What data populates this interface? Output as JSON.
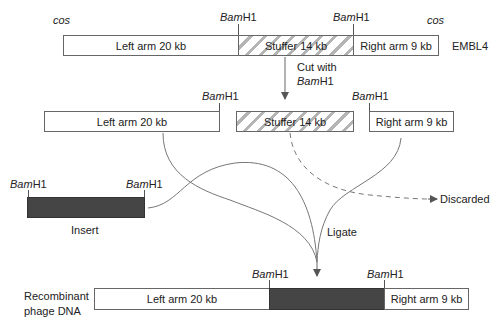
{
  "diagram": {
    "vector": {
      "name": "EMBL4",
      "cos_left": "cos",
      "cos_right": "cos",
      "site_left": {
        "italic": "Bam",
        "plain": "H1"
      },
      "site_right": {
        "italic": "Bam",
        "plain": "H1"
      },
      "segments": [
        {
          "label": "Left arm 20 kb",
          "fill": "white"
        },
        {
          "label": "Stuffer 14 kb",
          "fill": "hatched"
        },
        {
          "label": "Right arm 9 kb",
          "fill": "white"
        }
      ]
    },
    "step_cut": {
      "line1": "Cut  with",
      "enzyme_italic": "Bam",
      "enzyme_plain": "H1"
    },
    "fragments": {
      "left_site": {
        "italic": "Bam",
        "plain": "H1"
      },
      "right_site": {
        "italic": "Bam",
        "plain": "H1"
      },
      "left": "Left arm 20 kb",
      "stuffer": "Stuffer 14 kb",
      "right": "Right arm 9 kb"
    },
    "insert": {
      "label": "Insert",
      "site_left": {
        "italic": "Bam",
        "plain": "H1"
      },
      "site_right": {
        "italic": "Bam",
        "plain": "H1"
      },
      "fill_color": "#454545"
    },
    "discarded_label": "Discarded",
    "ligate_label": "Ligate",
    "recombinant": {
      "label_line1": "Recombinant",
      "label_line2": "phage  DNA",
      "site_left": {
        "italic": "Bam",
        "plain": "H1"
      },
      "site_right": {
        "italic": "Bam",
        "plain": "H1"
      },
      "segments": [
        {
          "label": "Left arm 20 kb",
          "fill": "white"
        },
        {
          "label": "",
          "fill": "dark"
        },
        {
          "label": "Right arm 9 kb",
          "fill": "white"
        }
      ]
    },
    "colors": {
      "line": "#6a6a6a",
      "dark_fill": "#454545",
      "hatch": "#b4b4b4",
      "text": "#222222"
    }
  }
}
